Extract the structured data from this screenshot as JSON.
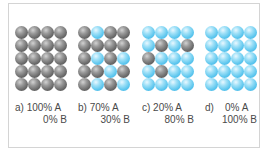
{
  "figure": {
    "panels": [
      {
        "id": "a",
        "line1": "a) 100% A",
        "line2": "0% B",
        "grid": [
          [
            "A",
            "A",
            "A",
            "A"
          ],
          [
            "A",
            "A",
            "A",
            "A"
          ],
          [
            "A",
            "A",
            "A",
            "A"
          ],
          [
            "A",
            "A",
            "A",
            "A"
          ],
          [
            "A",
            "A",
            "A",
            "A"
          ]
        ]
      },
      {
        "id": "b",
        "line1": "b) 70% A",
        "line2": "30% B",
        "grid": [
          [
            "A",
            "B",
            "A",
            "A"
          ],
          [
            "A",
            "A",
            "A",
            "A"
          ],
          [
            "A",
            "B",
            "A",
            "B"
          ],
          [
            "A",
            "A",
            "B",
            "A"
          ],
          [
            "A",
            "B",
            "A",
            "B"
          ]
        ]
      },
      {
        "id": "c",
        "line1": "c) 20% A",
        "line2": "80% B",
        "grid": [
          [
            "B",
            "B",
            "B",
            "B"
          ],
          [
            "B",
            "A",
            "B",
            "A"
          ],
          [
            "A",
            "B",
            "B",
            "B"
          ],
          [
            "B",
            "A",
            "B",
            "B"
          ],
          [
            "B",
            "B",
            "B",
            "B"
          ]
        ]
      },
      {
        "id": "d",
        "line1": "d)    0% A",
        "line2": "100% B",
        "grid": [
          [
            "B",
            "B",
            "B",
            "B"
          ],
          [
            "B",
            "B",
            "B",
            "B"
          ],
          [
            "B",
            "B",
            "B",
            "B"
          ],
          [
            "B",
            "B",
            "B",
            "B"
          ],
          [
            "B",
            "B",
            "B",
            "B"
          ]
        ]
      }
    ],
    "colors": {
      "A": "#7a7a7a",
      "B": "#5cc6ee",
      "text": "#4a4a4a",
      "border": "#d4d4d4"
    }
  }
}
